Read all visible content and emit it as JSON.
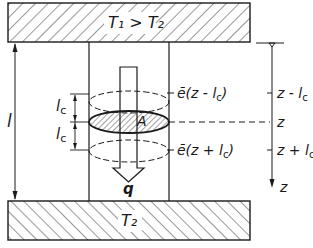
{
  "figure": {
    "type": "physics-schematic"
  },
  "plates": {
    "top": {
      "label": "T₁ > T₂",
      "hatch": "backslash"
    },
    "bottom": {
      "label": "T₂",
      "hatch": "slash"
    }
  },
  "dimensions": {
    "height": "l",
    "mixing_length_upper": "l",
    "mixing_length_upper_sub": "c",
    "mixing_length_lower": "l",
    "mixing_length_lower_sub": "c"
  },
  "cross_section": {
    "label": "A"
  },
  "flux": {
    "label": "q"
  },
  "energy_labels": {
    "upper": "ē(z - l",
    "upper_sub": "c",
    "upper_close": ")",
    "lower": "ē(z + l",
    "lower_sub": "c",
    "lower_close": ")"
  },
  "axis": {
    "label": "z",
    "ticks": [
      {
        "text": "z - l",
        "sub": "c"
      },
      {
        "text": "z",
        "sub": ""
      },
      {
        "text": "z + l",
        "sub": "c"
      }
    ]
  },
  "colors": {
    "ink": "#1a1a1a",
    "background": "#ffffff"
  }
}
